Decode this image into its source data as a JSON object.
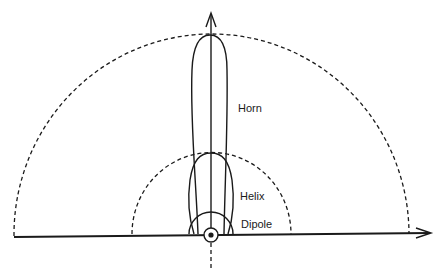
{
  "diagram": {
    "type": "antenna radiation pattern comparison",
    "labels": {
      "horn": "Horn",
      "helix": "Helix",
      "dipole": "Dipole"
    },
    "elements": [
      {
        "name": "horizontal-axis",
        "style": "solid arrow, pointing right"
      },
      {
        "name": "vertical-axis",
        "style": "solid arrow pointing up, dashed below origin"
      },
      {
        "name": "outer-reference-arc",
        "style": "dashed semicircle"
      },
      {
        "name": "inner-reference-arc",
        "style": "dashed semicircle"
      },
      {
        "name": "horn-lobe",
        "style": "narrow elongated lobe reaching outer arc"
      },
      {
        "name": "helix-lobe",
        "style": "medium lobe reaching inner arc"
      },
      {
        "name": "dipole-pattern",
        "style": "small semicircle around origin"
      },
      {
        "name": "origin-marker",
        "style": "circle with dot"
      }
    ],
    "colors": {
      "ink": "#1a1a1a",
      "background": "#ffffff"
    }
  }
}
